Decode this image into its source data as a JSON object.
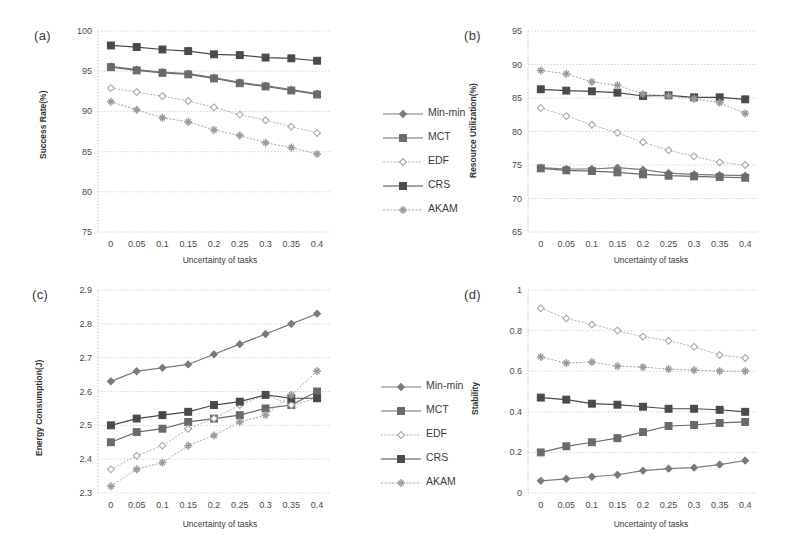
{
  "figure": {
    "panels": [
      {
        "tag": "(a)"
      },
      {
        "tag": "(b)"
      },
      {
        "tag": "(c)"
      },
      {
        "tag": "(d)"
      }
    ]
  },
  "legend": {
    "entries": [
      {
        "label": "Min-min",
        "color": "#7a7a7a",
        "marker": "diamond"
      },
      {
        "label": "MCT",
        "color": "#6a6a6a",
        "marker": "square"
      },
      {
        "label": "EDF",
        "color": "#a8a8a8",
        "marker": "diamond-open"
      },
      {
        "label": "CRS",
        "color": "#4a4a4a",
        "marker": "square-filled"
      },
      {
        "label": "AKAM",
        "color": "#9a9a9a",
        "marker": "star"
      }
    ]
  },
  "chart_data": [
    {
      "type": "line",
      "panel": "a",
      "title": "",
      "xlabel": "Uncertainty of tasks",
      "ylabel": "Success Rate(%)",
      "x": [
        0,
        0.05,
        0.1,
        0.15,
        0.2,
        0.25,
        0.3,
        0.35,
        0.4
      ],
      "xticklabels": [
        "0",
        "0.05",
        "0.1",
        "0.15",
        "0.2",
        "0.25",
        "0.3",
        "0.35",
        "0.4"
      ],
      "yticks": [
        75,
        80,
        85,
        90,
        95,
        100
      ],
      "yticklabels": [
        "75",
        "80",
        "85",
        "90",
        "95",
        "100"
      ],
      "ylim": [
        75,
        100
      ],
      "xlim": [
        -0.025,
        0.425
      ],
      "grid": true,
      "legend_position": "right",
      "series": [
        {
          "name": "Min-min",
          "values": [
            95.6,
            95.2,
            94.9,
            94.7,
            94.2,
            93.6,
            93.2,
            92.7,
            92.2
          ]
        },
        {
          "name": "MCT",
          "values": [
            95.5,
            95.1,
            94.8,
            94.6,
            94.1,
            93.5,
            93.1,
            92.6,
            92.1
          ]
        },
        {
          "name": "EDF",
          "values": [
            92.9,
            92.4,
            91.9,
            91.3,
            90.5,
            89.6,
            88.9,
            88.1,
            87.3
          ]
        },
        {
          "name": "CRS",
          "values": [
            98.2,
            98.0,
            97.7,
            97.5,
            97.1,
            97.0,
            96.7,
            96.6,
            96.3
          ]
        },
        {
          "name": "AKAM",
          "values": [
            91.2,
            90.2,
            89.2,
            88.7,
            87.7,
            87.0,
            86.1,
            85.5,
            84.7
          ]
        }
      ]
    },
    {
      "type": "line",
      "panel": "b",
      "title": "",
      "xlabel": "Uncertainty of tasks",
      "ylabel": "Resource Utilization(%)",
      "x": [
        0,
        0.05,
        0.1,
        0.15,
        0.2,
        0.25,
        0.3,
        0.35,
        0.4
      ],
      "xticklabels": [
        "0",
        "0.05",
        "0.1",
        "0.15",
        "0.2",
        "0.25",
        "0.3",
        "0.35",
        "0.4"
      ],
      "yticks": [
        65,
        70,
        75,
        80,
        85,
        90,
        95
      ],
      "yticklabels": [
        "65",
        "70",
        "75",
        "80",
        "85",
        "90",
        "95"
      ],
      "ylim": [
        65,
        95
      ],
      "xlim": [
        -0.025,
        0.425
      ],
      "grid": true,
      "legend_position": "none",
      "series": [
        {
          "name": "Min-min",
          "values": [
            74.6,
            74.4,
            74.4,
            74.6,
            74.3,
            73.8,
            73.6,
            73.5,
            73.4
          ]
        },
        {
          "name": "MCT",
          "values": [
            74.5,
            74.2,
            74.1,
            73.9,
            73.6,
            73.4,
            73.3,
            73.2,
            73.1
          ]
        },
        {
          "name": "EDF",
          "values": [
            83.5,
            82.3,
            81.0,
            79.8,
            78.4,
            77.2,
            76.3,
            75.4,
            75.0
          ]
        },
        {
          "name": "CRS",
          "values": [
            86.3,
            86.1,
            86.0,
            85.8,
            85.3,
            85.4,
            85.1,
            85.1,
            84.8
          ]
        },
        {
          "name": "AKAM",
          "values": [
            89.1,
            88.6,
            87.4,
            86.9,
            85.6,
            85.3,
            84.9,
            84.3,
            82.7
          ]
        }
      ]
    },
    {
      "type": "line",
      "panel": "c",
      "title": "",
      "xlabel": "Uncertainty of tasks",
      "ylabel": "Energy Consumption(J)",
      "x": [
        0,
        0.05,
        0.1,
        0.15,
        0.2,
        0.25,
        0.3,
        0.35,
        0.4
      ],
      "xticklabels": [
        "0",
        "0.05",
        "0.1",
        "0.15",
        "0.2",
        "0.25",
        "0.3",
        "0.35",
        "0.4"
      ],
      "yticks": [
        2.3,
        2.4,
        2.5,
        2.6,
        2.7,
        2.8,
        2.9
      ],
      "yticklabels": [
        "2.3",
        "2.4",
        "2.5",
        "2.6",
        "2.7",
        "2.8",
        "2.9"
      ],
      "ylim": [
        2.3,
        2.9
      ],
      "xlim": [
        -0.025,
        0.425
      ],
      "grid": true,
      "legend_position": "right",
      "series": [
        {
          "name": "Min-min",
          "values": [
            2.63,
            2.66,
            2.67,
            2.68,
            2.71,
            2.74,
            2.77,
            2.8,
            2.83
          ]
        },
        {
          "name": "MCT",
          "values": [
            2.45,
            2.48,
            2.49,
            2.51,
            2.52,
            2.53,
            2.55,
            2.56,
            2.6
          ]
        },
        {
          "name": "EDF",
          "values": [
            2.37,
            2.41,
            2.44,
            2.49,
            2.52,
            2.56,
            2.59,
            2.56,
            2.58
          ]
        },
        {
          "name": "CRS",
          "values": [
            2.5,
            2.52,
            2.53,
            2.54,
            2.56,
            2.57,
            2.59,
            2.58,
            2.58
          ]
        },
        {
          "name": "AKAM",
          "values": [
            2.32,
            2.37,
            2.39,
            2.44,
            2.47,
            2.51,
            2.53,
            2.59,
            2.66
          ]
        }
      ]
    },
    {
      "type": "line",
      "panel": "d",
      "title": "",
      "xlabel": "Uncertainty of tasks",
      "ylabel": "Stability",
      "x": [
        0,
        0.05,
        0.1,
        0.15,
        0.2,
        0.25,
        0.3,
        0.35,
        0.4
      ],
      "xticklabels": [
        "0",
        "0.05",
        "0.1",
        "0.15",
        "0.2",
        "0.25",
        "0.3",
        "0.35",
        "0.4"
      ],
      "yticks": [
        0,
        0.2,
        0.4,
        0.6,
        0.8,
        1
      ],
      "yticklabels": [
        "0",
        "0.2",
        "0.4",
        "0.6",
        "0.8",
        "1"
      ],
      "ylim": [
        0,
        1
      ],
      "xlim": [
        -0.025,
        0.425
      ],
      "grid": true,
      "legend_position": "none",
      "series": [
        {
          "name": "Min-min",
          "values": [
            0.06,
            0.07,
            0.08,
            0.09,
            0.11,
            0.12,
            0.125,
            0.14,
            0.16
          ]
        },
        {
          "name": "MCT",
          "values": [
            0.2,
            0.23,
            0.25,
            0.27,
            0.3,
            0.33,
            0.335,
            0.345,
            0.35
          ]
        },
        {
          "name": "EDF",
          "values": [
            0.91,
            0.86,
            0.83,
            0.8,
            0.77,
            0.75,
            0.72,
            0.68,
            0.665
          ]
        },
        {
          "name": "CRS",
          "values": [
            0.47,
            0.46,
            0.44,
            0.435,
            0.425,
            0.415,
            0.415,
            0.41,
            0.4
          ]
        },
        {
          "name": "AKAM",
          "values": [
            0.67,
            0.64,
            0.645,
            0.625,
            0.62,
            0.61,
            0.605,
            0.6,
            0.6
          ]
        }
      ]
    }
  ]
}
